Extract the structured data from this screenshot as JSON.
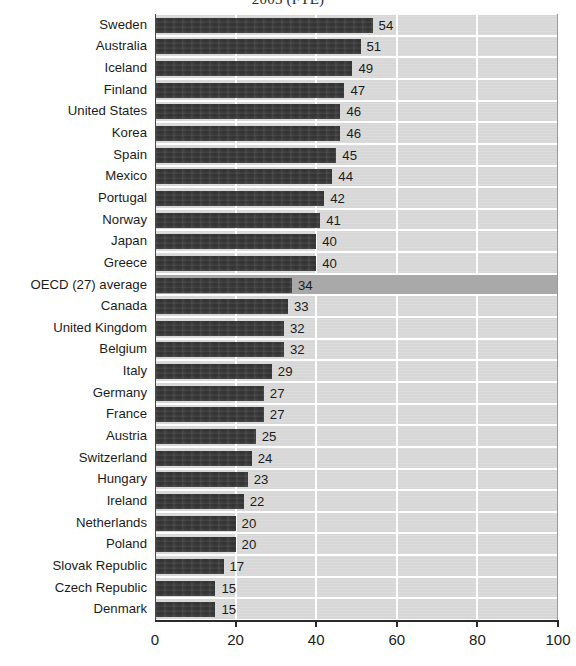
{
  "chart_data": {
    "type": "bar",
    "orientation": "horizontal",
    "title": "2003 (FTE)",
    "xlabel": "",
    "ylabel": "",
    "xlim": [
      0,
      100
    ],
    "xticks": [
      0,
      20,
      40,
      60,
      80,
      100
    ],
    "grid": true,
    "legend": "none",
    "highlight_category": "OECD (27) average",
    "categories": [
      "Sweden",
      "Australia",
      "Iceland",
      "Finland",
      "United States",
      "Korea",
      "Spain",
      "Mexico",
      "Portugal",
      "Norway",
      "Japan",
      "Greece",
      "OECD (27) average",
      "Canada",
      "United Kingdom",
      "Belgium",
      "Italy",
      "Germany",
      "France",
      "Austria",
      "Switzerland",
      "Hungary",
      "Ireland",
      "Netherlands",
      "Poland",
      "Slovak Republic",
      "Czech Republic",
      "Denmark"
    ],
    "values": [
      54,
      51,
      49,
      47,
      46,
      46,
      45,
      44,
      42,
      41,
      40,
      40,
      34,
      33,
      32,
      32,
      29,
      27,
      27,
      25,
      24,
      23,
      22,
      20,
      20,
      17,
      15,
      15
    ]
  },
  "colors": {
    "bar": "#3c3c3c",
    "plot_background": "#d9d9d9",
    "highlight_band": "#a9a9a9",
    "gridline": "#ffffff",
    "axis": "#2a2a2a",
    "text": "#1c1c1c"
  }
}
